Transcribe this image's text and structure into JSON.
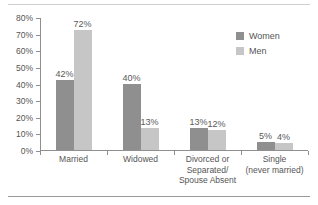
{
  "chart_data": {
    "type": "bar",
    "title": "",
    "subtitle": "",
    "xlabel": "",
    "ylabel": "",
    "ylim": [
      0,
      80
    ],
    "ytick_labels": [
      "0%",
      "10%",
      "20%",
      "30%",
      "40%",
      "50%",
      "60%",
      "70%",
      "80%"
    ],
    "ytick_values": [
      0,
      10,
      20,
      30,
      40,
      50,
      60,
      70,
      80
    ],
    "grid": false,
    "legend_position": "top-right",
    "categories": [
      {
        "lines": [
          "Married"
        ]
      },
      {
        "lines": [
          "Widowed"
        ]
      },
      {
        "lines": [
          "Divorced or",
          "Separated/",
          "Spouse Absent"
        ]
      },
      {
        "lines": [
          "Single",
          "(never married)"
        ]
      }
    ],
    "series": [
      {
        "name": "Women",
        "color": "#8f8f8f",
        "values": [
          42,
          40,
          13,
          5
        ],
        "labels": [
          "42%",
          "40%",
          "13%",
          "5%"
        ]
      },
      {
        "name": "Men",
        "color": "#c6c6c6",
        "values": [
          72,
          13,
          12,
          4
        ],
        "labels": [
          "72%",
          "13%",
          "12%",
          "4%"
        ]
      }
    ]
  },
  "legend": {
    "items": [
      {
        "label": "Women",
        "color": "#8f8f8f"
      },
      {
        "label": "Men",
        "color": "#c6c6c6"
      }
    ]
  }
}
